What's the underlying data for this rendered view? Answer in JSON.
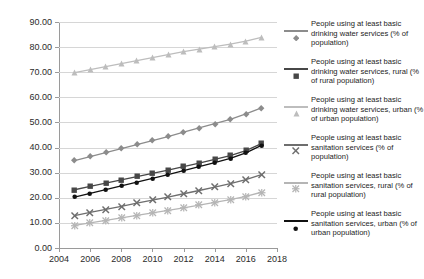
{
  "chart_data": {
    "type": "line",
    "title": "",
    "xlabel": "",
    "ylabel": "",
    "xlim": [
      2004,
      2018
    ],
    "ylim": [
      0,
      90
    ],
    "ytick_labels": [
      "0.00",
      "10.00",
      "20.00",
      "30.00",
      "40.00",
      "50.00",
      "60.00",
      "70.00",
      "80.00",
      "90.00"
    ],
    "ytick_values": [
      0,
      10,
      20,
      30,
      40,
      50,
      60,
      70,
      80,
      90
    ],
    "xtick_labels": [
      "2004",
      "2006",
      "2008",
      "2010",
      "2012",
      "2014",
      "2016",
      "2018"
    ],
    "xtick_values": [
      2004,
      2006,
      2008,
      2010,
      2012,
      2014,
      2016,
      2018
    ],
    "grid": true,
    "legend_position": "right",
    "x": [
      2005,
      2006,
      2007,
      2008,
      2009,
      2010,
      2011,
      2012,
      2013,
      2014,
      2015,
      2016,
      2017
    ],
    "series": [
      {
        "name": "People using at least basic drinking water services (% of population)",
        "marker": "diamond",
        "color": "#8c8c8c",
        "values": [
          34.8,
          36.4,
          38.0,
          39.6,
          41.2,
          42.8,
          44.4,
          46.1,
          47.8,
          49.5,
          51.2,
          53.4,
          55.8
        ]
      },
      {
        "name": "People using at least basic drinking water services, rural (% of rural population)",
        "marker": "square",
        "color": "#474747",
        "values": [
          23.2,
          24.5,
          25.8,
          27.1,
          28.4,
          29.7,
          31.0,
          32.4,
          33.8,
          35.3,
          36.8,
          38.8,
          41.6
        ]
      },
      {
        "name": "People using at least basic drinking water services, urban (% of urban population)",
        "marker": "triangle",
        "color": "#bdbdbd",
        "values": [
          69.8,
          71.0,
          72.2,
          73.4,
          74.6,
          75.8,
          77.0,
          78.2,
          79.2,
          80.2,
          81.2,
          82.4,
          83.9
        ]
      },
      {
        "name": "People using at least basic sanitation services (% of population)",
        "marker": "cross",
        "color": "#6e6e6e",
        "values": [
          12.9,
          14.2,
          15.4,
          16.6,
          17.9,
          19.1,
          20.3,
          21.6,
          22.9,
          24.2,
          25.6,
          27.2,
          29.2
        ]
      },
      {
        "name": "People using at least basic sanitation services, rural (% of rural population)",
        "marker": "asterisk",
        "color": "#b5b5b5",
        "values": [
          9.0,
          10.0,
          11.0,
          12.0,
          13.0,
          14.0,
          15.0,
          16.0,
          17.1,
          18.2,
          19.3,
          20.6,
          22.2
        ]
      },
      {
        "name": "People using at least basic sanitation services, urban (% of urban population)",
        "marker": "circle",
        "color": "#111111",
        "values": [
          20.3,
          21.8,
          23.2,
          24.7,
          26.2,
          27.7,
          29.2,
          30.8,
          32.4,
          34.0,
          35.7,
          37.9,
          40.9
        ]
      }
    ]
  },
  "legend": {
    "items": [
      {
        "label": "People using at least basic drinking water services (% of population)"
      },
      {
        "label": "People using at least basic drinking water services, rural (% of rural population)"
      },
      {
        "label": "People using at least basic drinking water services, urban (% of urban population)"
      },
      {
        "label": "People using at least basic sanitation services (% of population)"
      },
      {
        "label": "People using at least basic sanitation services, rural (% of rural population)"
      },
      {
        "label": "People using at least basic sanitation services, urban (% of urban population)"
      }
    ]
  }
}
